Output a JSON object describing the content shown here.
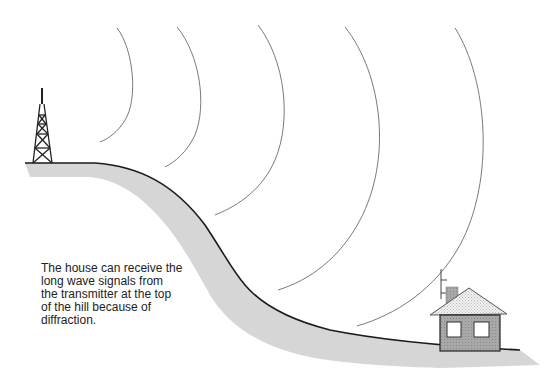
{
  "diagram": {
    "caption_lines": [
      "The house can receive the",
      "long wave signals from",
      "the transmitter at the top",
      "of the hill because of",
      "diffraction."
    ],
    "elements": {
      "transmitter": "transmitter-tower",
      "hill": "hill",
      "waves": "long-wave-wavefronts",
      "house": "house-with-antenna"
    },
    "wavefront_count": 5,
    "colors": {
      "ground_shadow": "#d4d4d4",
      "ground_line": "#1a1a1a",
      "wave_line": "#777777",
      "house_wall": "#9a9a9a",
      "roof": "#e6e6e6",
      "window": "#ffffff"
    }
  }
}
